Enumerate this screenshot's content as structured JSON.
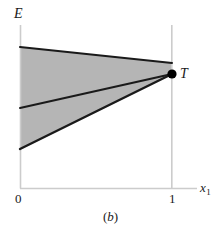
{
  "figure": {
    "caption_open_paren": "(",
    "caption_letter": "b",
    "caption_close_paren": ")",
    "axis_label_y": "E",
    "axis_label_x_base": "x",
    "axis_label_x_sub": "1",
    "point_label": "T",
    "tick_x_min": "0",
    "tick_x_max": "1"
  },
  "colors": {
    "shaded_region": "#b5b5b5",
    "boundary_line": "#1a1a1a",
    "axis_line": "#cccccc",
    "gridline": "#cccccc",
    "point_fill": "#000000",
    "text": "#1a1a1a",
    "background": "#ffffff"
  },
  "chart_data": {
    "type": "area",
    "title": "",
    "subtitle": "",
    "xlabel": "x1",
    "ylabel": "E",
    "xlim": [
      0,
      1
    ],
    "ylim": [
      0,
      1
    ],
    "grid": false,
    "legend": "none",
    "xticks": [
      0,
      1
    ],
    "xticklabels": [
      "0",
      "1"
    ],
    "yticks": [],
    "yticklabels": [],
    "annotations": [
      {
        "label": "T",
        "x": 1,
        "y": 0.7,
        "marker": "filled-circle"
      }
    ],
    "series": [
      {
        "name": "upper-boundary",
        "type": "line",
        "x": [
          0,
          1
        ],
        "y": [
          0.865,
          0.767
        ],
        "style": "solid",
        "width": 2
      },
      {
        "name": "middle-boundary",
        "type": "line",
        "x": [
          0,
          1
        ],
        "y": [
          0.491,
          0.7
        ],
        "style": "solid",
        "width": 2
      },
      {
        "name": "lower-boundary",
        "type": "line",
        "x": [
          0,
          1
        ],
        "y": [
          0.239,
          0.7
        ],
        "style": "solid",
        "width": 2
      }
    ],
    "shaded_region": {
      "name": "feasible-set",
      "fill": "#b5b5b5",
      "vertices_px": [
        [
          20,
          47
        ],
        [
          172,
          63
        ],
        [
          172,
          74
        ],
        [
          20,
          149
        ]
      ],
      "vertices_data": [
        [
          0,
          0.865
        ],
        [
          1,
          0.767
        ],
        [
          1,
          0.7
        ],
        [
          0,
          0.239
        ]
      ]
    },
    "pixel_geometry": {
      "origin_px": [
        20,
        188
      ],
      "x1_px": 172,
      "y_axis_top_px": 25,
      "x_axis_end_px": 197,
      "point_T_px": [
        172,
        74
      ],
      "point_T_radius_px": 4.6
    }
  }
}
